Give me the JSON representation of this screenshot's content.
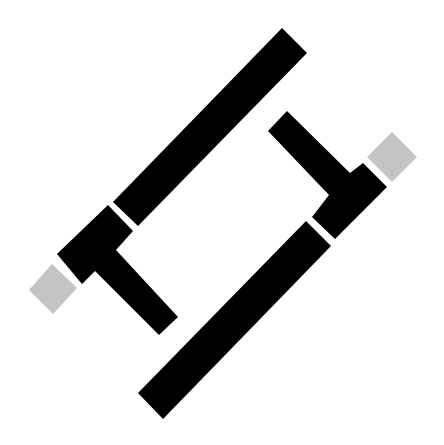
{
  "figure": {
    "background_color": "#ffffff",
    "colors": {
      "primary": "#000000",
      "accent": "#c4c4c4"
    },
    "shapes": {
      "left_t_piece": {
        "color": "#000000",
        "points": "57,254 108,205 133,231 116,250 178,317 159,335 95,271 82,284"
      },
      "right_t_piece": {
        "color": "#000000",
        "points": "363,163 387,187 335,239 312,217 329,195 268,131 287,111 350,173"
      },
      "upper_long_bar": {
        "color": "#000000",
        "points": "113,202 282,28 307,53 138,226"
      },
      "lower_long_bar": {
        "color": "#000000",
        "points": "138,393 306,221 331,246 163,419"
      },
      "left_gray_square": {
        "color": "#c4c4c4",
        "points": "29,290 52,264 77,288 53,314"
      },
      "right_gray_square": {
        "color": "#c4c4c4",
        "points": "367,157 392,132 417,157 392,182"
      }
    }
  }
}
